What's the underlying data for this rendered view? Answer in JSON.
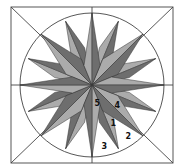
{
  "diagram": {
    "colors": {
      "background": "#ffffff",
      "line": "#444444",
      "light": "#ababab",
      "dark": "#6e6e6e"
    },
    "geometry": {
      "square": {
        "x": 11,
        "y": 7,
        "w": 162,
        "h": 156
      },
      "center": {
        "x": 92,
        "y": 85
      },
      "circle_r": 72
    },
    "labels": [
      {
        "text": "5",
        "x": 94.5,
        "y": 106
      },
      {
        "text": "4",
        "x": 114.5,
        "y": 108
      },
      {
        "text": "1",
        "x": 110.5,
        "y": 126
      },
      {
        "text": "2",
        "x": 125.5,
        "y": 139
      },
      {
        "text": "3",
        "x": 101.5,
        "y": 149
      }
    ]
  }
}
